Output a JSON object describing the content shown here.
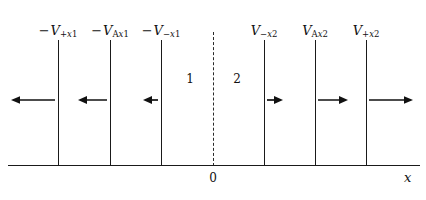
{
  "figure": {
    "type": "physics-potential-diagram",
    "background_color": "#ffffff",
    "line_color": "#1a1a1a",
    "width": 426,
    "height": 200
  },
  "axis": {
    "name": "x-axis",
    "label": "x",
    "origin_label": "0",
    "origin_x": 213,
    "y": 165,
    "x_start": 8,
    "x_end": 420
  },
  "center_line": {
    "name": "interface-dashed-line",
    "x": 213,
    "y_top": 32,
    "y_bottom": 165,
    "style": "dashed"
  },
  "regions": [
    {
      "id": "region-1",
      "label": "1",
      "x": 190,
      "y": 78
    },
    {
      "id": "region-2",
      "label": "2",
      "x": 237,
      "y": 78
    }
  ],
  "barriers": [
    {
      "id": "barrier-plus-x1",
      "x": 58,
      "y_top": 40,
      "y_bottom": 165,
      "label_prefix": "−",
      "label_symbol": "V",
      "label_sub_sign": "+",
      "label_sub_axis": "x",
      "label_sub_index": "1",
      "label_text": "−V+x1",
      "label_x": 58,
      "label_y": 24
    },
    {
      "id": "barrier-A-x1",
      "x": 110,
      "y_top": 40,
      "y_bottom": 165,
      "label_prefix": "−",
      "label_symbol": "V",
      "label_sub_sign": "A",
      "label_sub_axis": "x",
      "label_sub_index": "1",
      "label_text": "−VAx1",
      "label_x": 110,
      "label_y": 24
    },
    {
      "id": "barrier-minus-x1",
      "x": 161,
      "y_top": 40,
      "y_bottom": 165,
      "label_prefix": "−",
      "label_symbol": "V",
      "label_sub_sign": "−",
      "label_sub_axis": "x",
      "label_sub_index": "1",
      "label_text": "−V−x1",
      "label_x": 161,
      "label_y": 24
    },
    {
      "id": "barrier-minus-x2",
      "x": 264,
      "y_top": 40,
      "y_bottom": 165,
      "label_prefix": "",
      "label_symbol": "V",
      "label_sub_sign": "−",
      "label_sub_axis": "x",
      "label_sub_index": "2",
      "label_text": "V−x2",
      "label_x": 264,
      "label_y": 24
    },
    {
      "id": "barrier-A-x2",
      "x": 315,
      "y_top": 40,
      "y_bottom": 165,
      "label_prefix": "",
      "label_symbol": "V",
      "label_sub_sign": "A",
      "label_sub_axis": "x",
      "label_sub_index": "2",
      "label_text": "VAx2",
      "label_x": 315,
      "label_y": 24
    },
    {
      "id": "barrier-plus-x2",
      "x": 366,
      "y_top": 40,
      "y_bottom": 165,
      "label_prefix": "",
      "label_symbol": "V",
      "label_sub_sign": "+",
      "label_sub_axis": "x",
      "label_sub_index": "2",
      "label_text": "V+x2",
      "label_x": 366,
      "label_y": 24
    }
  ],
  "arrows": [
    {
      "id": "arrow-left-1",
      "direction": "left",
      "x_tail": 55,
      "x_head": 11,
      "y": 100,
      "length": 44
    },
    {
      "id": "arrow-left-2",
      "direction": "left",
      "x_tail": 107,
      "x_head": 78,
      "y": 100,
      "length": 29
    },
    {
      "id": "arrow-left-3",
      "direction": "left",
      "x_tail": 158,
      "x_head": 143,
      "y": 100,
      "length": 15
    },
    {
      "id": "arrow-right-1",
      "direction": "right",
      "x_tail": 267,
      "x_head": 283,
      "y": 100,
      "length": 16
    },
    {
      "id": "arrow-right-2",
      "direction": "right",
      "x_tail": 318,
      "x_head": 348,
      "y": 100,
      "length": 30
    },
    {
      "id": "arrow-right-3",
      "direction": "right",
      "x_tail": 369,
      "x_head": 413,
      "y": 100,
      "length": 44
    }
  ]
}
